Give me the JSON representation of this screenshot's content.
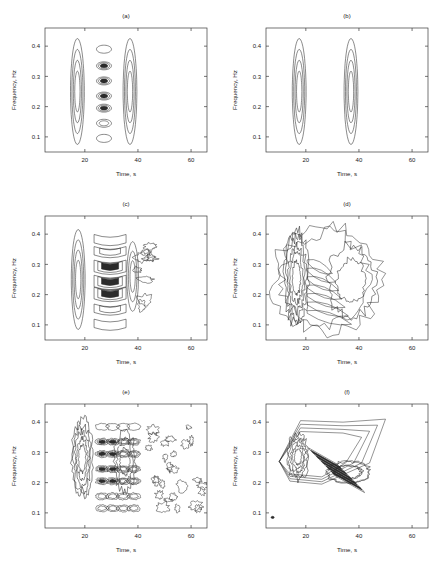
{
  "figure": {
    "background_color": "#ffffff",
    "line_color": "#2b2b2b",
    "axis_color": "#3a3a3a",
    "rows": 3,
    "cols": 2,
    "panel_count": 6
  },
  "axes": {
    "xlabel": "Time, s",
    "ylabel": "Frequency, Hz",
    "xticks": [
      20,
      40,
      60
    ],
    "xticklabels": [
      "20",
      "40",
      "60"
    ],
    "yticks": [
      0.1,
      0.2,
      0.3,
      0.4
    ],
    "yticklabels": [
      "0.1",
      "0.2",
      "0.3",
      "0.4"
    ],
    "xlim": [
      5,
      66
    ],
    "ylim": [
      0.05,
      0.46
    ],
    "grid": false,
    "box": true
  },
  "chart_data": {
    "type": "line",
    "title": "",
    "xlabel": "Time, s",
    "ylabel": "Frequency, Hz",
    "xlim": [
      5,
      66
    ],
    "ylim": [
      0.05,
      0.46
    ],
    "grid": false,
    "legend_position": "none",
    "panels": [
      {
        "id": "a",
        "title": "(a)",
        "xlabel": "Time, s",
        "ylabel": "Frequency, Hz",
        "xticklabels": [
          "20",
          "40",
          "60"
        ],
        "yticklabels": [
          "0.1",
          "0.2",
          "0.3",
          "0.4"
        ],
        "components": [
          {
            "name": "auto-term-1",
            "center_t": 17.2,
            "center_f": 0.25,
            "half_width_t": 2.6,
            "half_height_f": 0.175,
            "levels": 4
          },
          {
            "name": "auto-term-2",
            "center_t": 37.0,
            "center_f": 0.25,
            "half_width_t": 2.6,
            "half_height_f": 0.175,
            "levels": 4
          }
        ],
        "cross_terms": {
          "present": true,
          "center_t": 27.2,
          "shape": "vertical stack of discrete concentric-ring blobs",
          "blob_frequencies": [
            0.39,
            0.335,
            0.285,
            0.235,
            0.195,
            0.145,
            0.095
          ],
          "blob_levels": [
            1,
            3,
            3,
            3,
            3,
            2,
            1
          ]
        }
      },
      {
        "id": "b",
        "title": "(b)",
        "xlabel": "Time, s",
        "ylabel": "Frequency, Hz",
        "xticklabels": [
          "20",
          "40",
          "60"
        ],
        "yticklabels": [
          "0.1",
          "0.2",
          "0.3",
          "0.4"
        ],
        "components": [
          {
            "name": "auto-term-1",
            "center_t": 17.5,
            "center_f": 0.25,
            "half_width_t": 2.6,
            "half_height_f": 0.175,
            "levels": 4
          },
          {
            "name": "auto-term-2",
            "center_t": 37.0,
            "center_f": 0.25,
            "half_width_t": 2.6,
            "half_height_f": 0.175,
            "levels": 4
          }
        ],
        "cross_terms": {
          "present": false,
          "shape": "none",
          "blob_frequencies": [],
          "blob_levels": []
        }
      },
      {
        "id": "c",
        "title": "(c)",
        "xlabel": "Time, s",
        "ylabel": "Frequency, Hz",
        "xticklabels": [
          "20",
          "40",
          "60"
        ],
        "yticklabels": [
          "0.1",
          "0.2",
          "0.3",
          "0.4"
        ],
        "components": [
          {
            "name": "auto-term-1",
            "center_t": 17.5,
            "center_f": 0.25,
            "half_width_t": 2.6,
            "half_height_f": 0.165,
            "levels": 4
          },
          {
            "name": "auto-term-2",
            "center_t": 38.0,
            "center_f": 0.26,
            "half_width_t": 2.2,
            "half_height_f": 0.115,
            "levels": 3
          }
        ],
        "cross_terms": {
          "present": true,
          "center_t": 29.5,
          "shape": "stack of dark crescent arcs curving to the right plus ragged lobes near t=40",
          "blob_frequencies": [
            0.385,
            0.345,
            0.295,
            0.245,
            0.205,
            0.155,
            0.105
          ],
          "blob_levels": [
            1,
            2,
            3,
            3,
            3,
            2,
            1
          ]
        }
      },
      {
        "id": "d",
        "title": "(d)",
        "xlabel": "Time, s",
        "ylabel": "Frequency, Hz",
        "xticklabels": [
          "20",
          "40",
          "60"
        ],
        "yticklabels": [
          "0.1",
          "0.2",
          "0.3",
          "0.4"
        ],
        "components": [
          {
            "name": "auto-term-1",
            "center_t": 16.5,
            "center_f": 0.255,
            "half_width_t": 4.5,
            "half_height_f": 0.16,
            "levels": 5
          },
          {
            "name": "auto-term-2",
            "center_t": 37.0,
            "center_f": 0.245,
            "half_width_t": 9.0,
            "half_height_f": 0.12,
            "levels": 2
          }
        ],
        "cross_terms": {
          "present": true,
          "center_t": 24.0,
          "shape": "smooth diagonal streaks joining the two lobes; low-level outer envelope",
          "blob_frequencies": [
            0.3,
            0.25,
            0.2,
            0.16
          ],
          "blob_levels": [
            1,
            2,
            2,
            1
          ]
        }
      },
      {
        "id": "e",
        "title": "(e)",
        "xlabel": "Time, s",
        "ylabel": "Frequency, Hz",
        "xticklabels": [
          "20",
          "40",
          "60"
        ],
        "yticklabels": [
          "0.1",
          "0.2",
          "0.3",
          "0.4"
        ],
        "components": [
          {
            "name": "auto-term-1",
            "center_t": 19.0,
            "center_f": 0.28,
            "half_width_t": 4.0,
            "half_height_f": 0.13,
            "levels": 5
          },
          {
            "name": "auto-term-2",
            "center_t": 35.0,
            "center_f": 0.27,
            "half_width_t": 4.0,
            "half_height_f": 0.1,
            "levels": 3
          }
        ],
        "cross_terms": {
          "present": true,
          "center_t": 30.0,
          "shape": "dense oscillatory ripples with irregular islands trailing right to t=65",
          "blob_frequencies": [
            0.385,
            0.335,
            0.295,
            0.245,
            0.205,
            0.155,
            0.115
          ],
          "blob_levels": [
            1,
            3,
            3,
            3,
            3,
            2,
            2
          ]
        }
      },
      {
        "id": "f",
        "title": "(f)",
        "xlabel": "Time, s",
        "ylabel": "Frequency, Hz",
        "xticklabels": [
          "20",
          "40",
          "60"
        ],
        "yticklabels": [
          "0.1",
          "0.2",
          "0.3",
          "0.4"
        ],
        "components": [
          {
            "name": "auto-term-1",
            "center_t": 17.0,
            "center_f": 0.285,
            "half_width_t": 4.0,
            "half_height_f": 0.075,
            "levels": 5
          },
          {
            "name": "auto-term-2",
            "center_t": 36.0,
            "center_f": 0.235,
            "half_width_t": 8.0,
            "half_height_f": 0.035,
            "levels": 2
          }
        ],
        "cross_terms": {
          "present": true,
          "center_t": 28.0,
          "shape": "elongated wedge tilting up to the right with dense diagonal stripes",
          "blob_frequencies": [
            0.31,
            0.29,
            0.27,
            0.25,
            0.23
          ],
          "blob_levels": [
            2,
            2,
            2,
            2,
            2
          ]
        }
      }
    ]
  }
}
